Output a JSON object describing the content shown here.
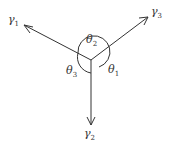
{
  "diagram": {
    "vectors": [
      {
        "name": "γ",
        "sub": "1"
      },
      {
        "name": "γ",
        "sub": "2"
      },
      {
        "name": "γ",
        "sub": "3"
      }
    ],
    "angles": [
      {
        "name": "θ",
        "sub": "1"
      },
      {
        "name": "θ",
        "sub": "2"
      },
      {
        "name": "θ",
        "sub": "3"
      }
    ],
    "colors": {
      "stroke": "#333333"
    }
  }
}
